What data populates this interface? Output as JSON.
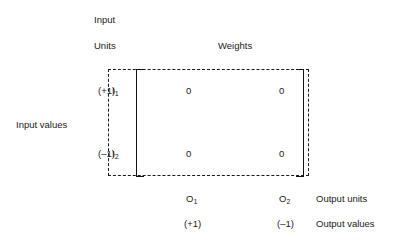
{
  "figure": {
    "headers": {
      "input_line1": "Input",
      "input_line2": "Units",
      "weights": "Weights"
    },
    "left_axis": {
      "caption": "Input values",
      "rows": [
        {
          "value": "(+1)",
          "unit": "I",
          "unit_subscript": "1"
        },
        {
          "value": "(–1)",
          "unit": "I",
          "unit_subscript": "2"
        }
      ]
    },
    "matrix": {
      "rows": [
        [
          "0",
          "0"
        ],
        [
          "0",
          "0"
        ]
      ]
    },
    "bottom_axis": {
      "units_caption": "Output units",
      "values_caption": "Output values",
      "columns": [
        {
          "unit": "O",
          "unit_subscript": "1",
          "value": "(+1)"
        },
        {
          "unit": "O",
          "unit_subscript": "2",
          "value": "(–1)"
        }
      ]
    },
    "style": {
      "ink": "#1a1a1a",
      "bracket": "#111111",
      "background": "#ffffff"
    }
  }
}
